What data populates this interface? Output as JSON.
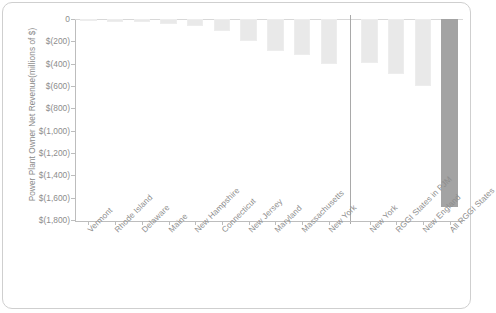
{
  "chart_data": {
    "type": "bar",
    "title": "",
    "xlabel": "",
    "ylabel": "Power Plant Owner Net Revenue(millions of $)",
    "ylim": [
      -1800,
      0
    ],
    "y_tick_labels": [
      "0",
      "$(200)",
      "$(400)",
      "$(600)",
      "$(800)",
      "$(1,000)",
      "$(1,200)",
      "$(1,400)",
      "$(1,600)",
      "$(1,800)"
    ],
    "y_tick_values": [
      0,
      -200,
      -400,
      -600,
      -800,
      -1000,
      -1200,
      -1400,
      -1600,
      -1800
    ],
    "grid": false,
    "legend": "none",
    "groups": [
      {
        "name": "individual-states",
        "categories": [
          "Vermont",
          "Rhode Island",
          "Delaware",
          "Maine",
          "New Hampshire",
          "Connecticut",
          "New Jersey",
          "Maryland",
          "Massachusetts",
          "New York"
        ],
        "values": [
          -5,
          -25,
          -30,
          -45,
          -65,
          -110,
          -200,
          -290,
          -320,
          -400
        ],
        "color": "#e9e9e9"
      },
      {
        "name": "aggregates",
        "categories": [
          "New York",
          "RGGI States in PJM",
          "New England",
          "All RGGI States"
        ],
        "values": [
          -390,
          -490,
          -600,
          -1680
        ],
        "colors": [
          "#e9e9e9",
          "#e9e9e9",
          "#e9e9e9",
          "#a3a3a3"
        ]
      }
    ],
    "categories": [
      "Vermont",
      "Rhode Island",
      "Delaware",
      "Maine",
      "New Hampshire",
      "Connecticut",
      "New Jersey",
      "Maryland",
      "Massachusetts",
      "New York",
      "New York",
      "RGGI States in PJM",
      "New England",
      "All RGGI States"
    ],
    "values": [
      -5,
      -25,
      -30,
      -45,
      -65,
      -110,
      -200,
      -290,
      -320,
      -400,
      -390,
      -490,
      -600,
      -1680
    ],
    "separator": {
      "after_category_index": 9,
      "style": "vertical-line",
      "color": "#a9a9a9"
    },
    "colors": {
      "bar_light": "#e9e9e9",
      "bar_dark": "#a3a3a3",
      "axis": "#bdbdbd",
      "text": "#8d8d8d"
    }
  }
}
